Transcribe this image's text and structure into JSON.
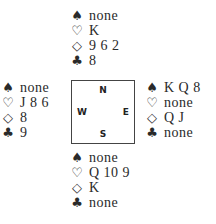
{
  "suit_symbols": {
    "spades": "♠",
    "hearts": "♡",
    "diamonds": "◇",
    "clubs": "♣"
  },
  "compass": {
    "north": "N",
    "south": "S",
    "west": "W",
    "east": "E"
  },
  "hands": {
    "north": {
      "spades": "none",
      "hearts": "K",
      "diamonds": "9 6 2",
      "clubs": "8"
    },
    "west": {
      "spades": "none",
      "hearts": "J 8 6",
      "diamonds": "8",
      "clubs": "9"
    },
    "east": {
      "spades": "K Q 8",
      "hearts": "none",
      "diamonds": "Q J",
      "clubs": "none"
    },
    "south": {
      "spades": "none",
      "hearts": "Q 10 9",
      "diamonds": "K",
      "clubs": "none"
    }
  }
}
